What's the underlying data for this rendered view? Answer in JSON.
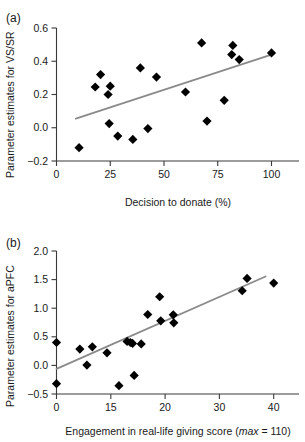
{
  "figure": {
    "panels": [
      {
        "label": "(a)",
        "chart_data": {
          "type": "scatter",
          "title": "",
          "xlabel": "Decision to donate (%)",
          "ylabel": "Parameter estimates for VS/SR",
          "xticks": [
            0,
            25,
            50,
            75,
            100
          ],
          "xtick_labels": [
            "0",
            "25",
            "50",
            "75",
            "100"
          ],
          "yticks": [
            -0.2,
            0.0,
            0.2,
            0.4,
            0.6
          ],
          "ytick_labels": [
            "−0.2",
            "0.0",
            "0.2",
            "0.4",
            "0.6"
          ],
          "xlim": [
            0,
            110
          ],
          "ylim": [
            -0.2,
            0.6
          ],
          "grid": false,
          "legend": false,
          "points": [
            {
              "x": 10.5,
              "y": -0.12
            },
            {
              "x": 18.0,
              "y": 0.245
            },
            {
              "x": 20.5,
              "y": 0.32
            },
            {
              "x": 24.0,
              "y": 0.2
            },
            {
              "x": 25.0,
              "y": 0.25
            },
            {
              "x": 24.5,
              "y": 0.025
            },
            {
              "x": 28.5,
              "y": -0.05
            },
            {
              "x": 35.5,
              "y": -0.07
            },
            {
              "x": 39.0,
              "y": 0.36
            },
            {
              "x": 42.5,
              "y": -0.005
            },
            {
              "x": 46.5,
              "y": 0.305
            },
            {
              "x": 60.0,
              "y": 0.215
            },
            {
              "x": 67.5,
              "y": 0.51
            },
            {
              "x": 70.0,
              "y": 0.04
            },
            {
              "x": 78.0,
              "y": 0.165
            },
            {
              "x": 82.0,
              "y": 0.495
            },
            {
              "x": 81.5,
              "y": 0.44
            },
            {
              "x": 85.0,
              "y": 0.41
            },
            {
              "x": 100.0,
              "y": 0.45
            }
          ],
          "trend_line": {
            "x0": 9.0,
            "y0": 0.055,
            "x1": 100.0,
            "y1": 0.44
          }
        }
      },
      {
        "label": "(b)",
        "chart_data": {
          "type": "scatter",
          "title": "",
          "xlabel_prefix": "Engagement in real-life giving score (",
          "xlabel_italic": "max",
          "xlabel_suffix": " = 110)",
          "xlabel": "Engagement in real-life giving score (max = 110)",
          "ylabel": "Parameter estimates for aPFC",
          "xticks": [
            0,
            10,
            20,
            30,
            40
          ],
          "xtick_labels": [
            "0",
            "15",
            "20",
            "30",
            "40"
          ],
          "yticks": [
            -0.5,
            0.0,
            0.5,
            1.0,
            1.5,
            2.0
          ],
          "ytick_labels": [
            "−0.5",
            "0.0",
            "0.5",
            "1.0",
            "1.5",
            "2.0"
          ],
          "xlim": [
            0,
            43
          ],
          "ylim": [
            -0.5,
            2.0
          ],
          "grid": false,
          "legend": false,
          "points": [
            {
              "x": 0.0,
              "y": 0.4
            },
            {
              "x": 0.0,
              "y": -0.32
            },
            {
              "x": 4.3,
              "y": 0.285
            },
            {
              "x": 5.6,
              "y": 0.005
            },
            {
              "x": 6.6,
              "y": 0.325
            },
            {
              "x": 9.3,
              "y": 0.22
            },
            {
              "x": 11.5,
              "y": -0.355
            },
            {
              "x": 13.0,
              "y": 0.42
            },
            {
              "x": 13.6,
              "y": 0.4
            },
            {
              "x": 14.0,
              "y": 0.385
            },
            {
              "x": 14.3,
              "y": -0.175
            },
            {
              "x": 15.6,
              "y": 0.375
            },
            {
              "x": 16.8,
              "y": 0.89
            },
            {
              "x": 19.0,
              "y": 1.2
            },
            {
              "x": 19.2,
              "y": 0.78
            },
            {
              "x": 21.5,
              "y": 0.885
            },
            {
              "x": 21.6,
              "y": 0.745
            },
            {
              "x": 34.2,
              "y": 1.305
            },
            {
              "x": 35.1,
              "y": 1.52
            },
            {
              "x": 40.0,
              "y": 1.44
            }
          ],
          "trend_line": {
            "x0": 0.0,
            "y0": -0.06,
            "x1": 38.5,
            "y1": 1.555
          }
        }
      }
    ]
  }
}
